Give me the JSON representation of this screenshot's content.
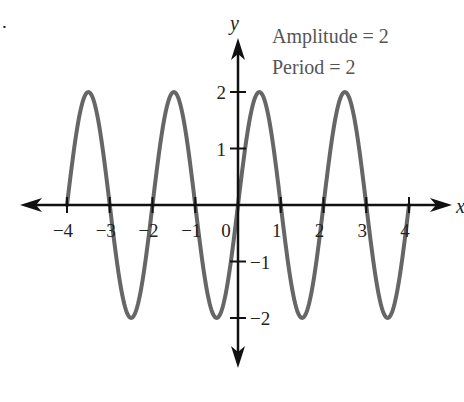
{
  "chart_data": {
    "type": "line",
    "title": "",
    "function": "y = 2 sin(pi x)",
    "xlabel": "x",
    "ylabel": "y",
    "xlim": [
      -4,
      4
    ],
    "ylim": [
      -2,
      2
    ],
    "x_ticks": [
      -4,
      -3,
      -2,
      -1,
      0,
      1,
      2,
      3,
      4
    ],
    "x_tick_labels": [
      "−4",
      "−3",
      "−2",
      "−1",
      "0",
      "1",
      "2",
      "3",
      "4"
    ],
    "y_ticks": [
      2,
      1,
      -1,
      -2
    ],
    "y_tick_labels": [
      "2",
      "1",
      "−1",
      "−2"
    ],
    "grid": false,
    "series": [
      {
        "name": "y = 2 sin(πx)",
        "color": "#666666",
        "x": [
          -4,
          -3.5,
          -3,
          -2.5,
          -2,
          -1.5,
          -1,
          -0.5,
          0,
          0.5,
          1,
          1.5,
          2,
          2.5,
          3,
          3.5,
          4
        ],
        "y": [
          0,
          2,
          0,
          -2,
          0,
          2,
          0,
          -2,
          0,
          2,
          0,
          -2,
          0,
          2,
          0,
          -2,
          0
        ]
      }
    ],
    "annotations": [
      "Amplitude = 2",
      "Period = 2"
    ]
  },
  "labels": {
    "marker": ".",
    "x_axis": "x",
    "y_axis": "y",
    "amplitude": "Amplitude = 2",
    "period": "Period = 2"
  },
  "colors": {
    "curve": "#666666",
    "axes": "#111111"
  }
}
